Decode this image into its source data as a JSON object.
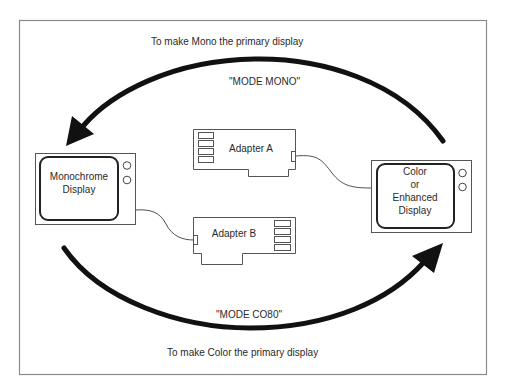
{
  "diagram": {
    "top_caption": "To make Mono the primary display",
    "top_command": "\"MODE  MONO\"",
    "bottom_command": "\"MODE  CO80\"",
    "bottom_caption": "To make Color the primary display",
    "mono_display": {
      "line1": "Monochrome",
      "line2": "Display"
    },
    "color_display": {
      "line1": "Color",
      "line2": "or",
      "line3": "Enhanced",
      "line4": "Display"
    },
    "adapter_a": {
      "label": "Adapter A"
    },
    "adapter_b": {
      "label": "Adapter B"
    },
    "colors": {
      "arrow": "#111111",
      "frame": "#8a8a8a",
      "line": "#3a3a3a"
    }
  }
}
